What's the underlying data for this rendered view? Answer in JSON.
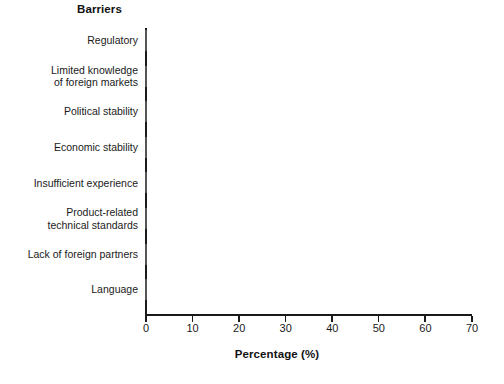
{
  "chart_data": {
    "type": "bar",
    "orientation": "horizontal",
    "title": "Barriers",
    "xlabel": "Percentage (%)",
    "ylabel": "Barriers",
    "grid": false,
    "legend": null,
    "xlim": [
      0,
      70
    ],
    "xticks": [
      0,
      10,
      20,
      30,
      40,
      50,
      60,
      70
    ],
    "xtick_labels": [
      "0",
      "10",
      "20",
      "30",
      "40",
      "50",
      "60",
      "70"
    ],
    "categories": [
      "Regulatory",
      "Limited knowledge\nof foreign markets",
      "Political stability",
      "Economic stability",
      "Insufficient experience",
      "Product-related\ntechnical standards",
      "Lack of foreign partners",
      "Language"
    ],
    "values": [
      67.5,
      52,
      47,
      46,
      45,
      39,
      37,
      35
    ],
    "bar_fill_color": "#cccccc",
    "bar_edge_color": "#555555",
    "axis_color": "#1a1a1a",
    "background_color": "#ffffff"
  },
  "chart": {
    "title": "Barriers",
    "axis_title_x": "Percentage (%)"
  }
}
